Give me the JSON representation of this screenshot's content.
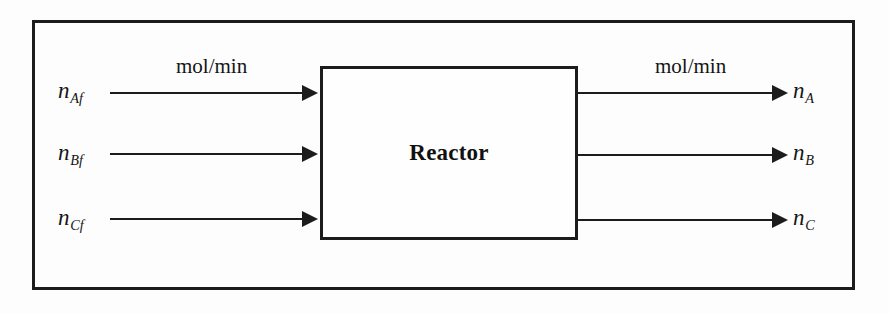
{
  "diagram": {
    "unit_block": {
      "label": "Reactor"
    },
    "units": {
      "inlet_units": "mol/min",
      "outlet_units": "mol/min"
    },
    "inlet_streams": [
      {
        "symbol": "n",
        "subscript": "Af"
      },
      {
        "symbol": "n",
        "subscript": "Bf"
      },
      {
        "symbol": "n",
        "subscript": "Cf"
      }
    ],
    "outlet_streams": [
      {
        "symbol": "n",
        "subscript": "A"
      },
      {
        "symbol": "n",
        "subscript": "B"
      },
      {
        "symbol": "n",
        "subscript": "C"
      }
    ],
    "colors": {
      "stroke": "#1c1c1c",
      "background": "#fdfdfd",
      "text": "#151515"
    }
  }
}
